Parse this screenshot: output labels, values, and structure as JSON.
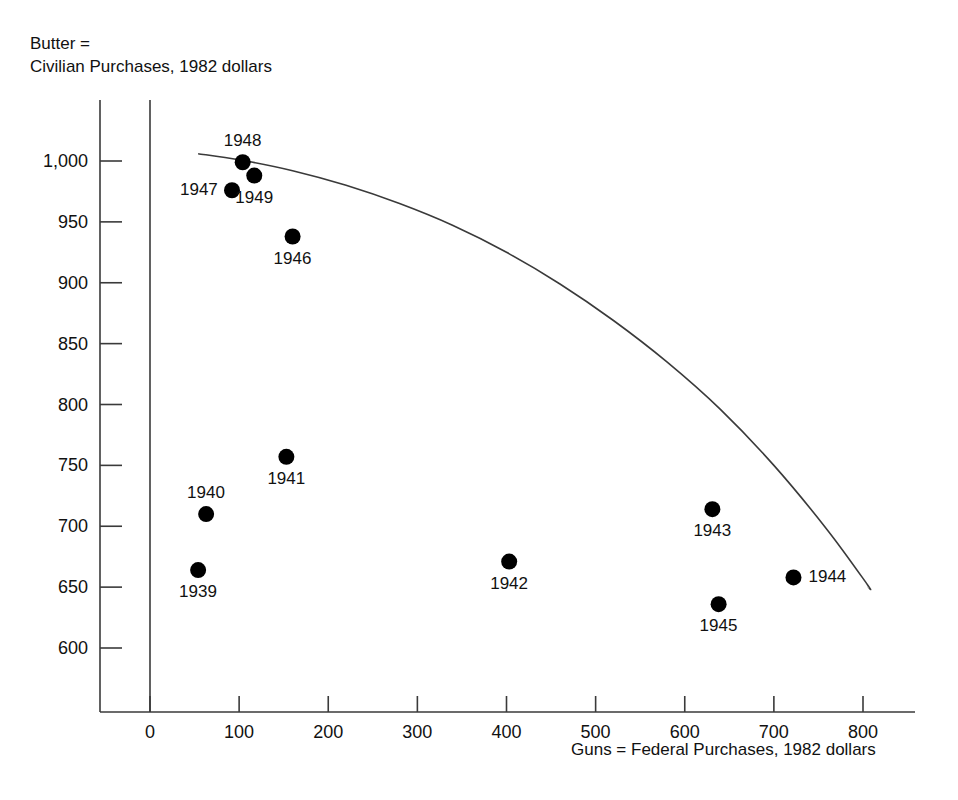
{
  "chart_data": {
    "type": "scatter",
    "title": "",
    "ylabel": "Butter =\nCivilian Purchases, 1982 dollars",
    "xlabel": "Guns = Federal Purchases, 1982 dollars",
    "xlim": [
      0,
      800
    ],
    "ylim": [
      570,
      1010
    ],
    "xticks": [
      0,
      100,
      200,
      300,
      400,
      500,
      600,
      700,
      800
    ],
    "xtick_labels": [
      "0",
      "100",
      "200",
      "300",
      "400",
      "500",
      "600",
      "700",
      "800"
    ],
    "yticks": [
      600,
      650,
      700,
      750,
      800,
      850,
      900,
      950,
      1000
    ],
    "ytick_labels": [
      "600",
      "650",
      "700",
      "750",
      "800",
      "850",
      "900",
      "950",
      "1,000"
    ],
    "grid": false,
    "legend": null,
    "point_color": "#000000",
    "curve_color": "#3a3a3a",
    "axis_color": "#3a3a3a",
    "points": [
      {
        "label": "1939",
        "x": 54,
        "y": 664,
        "label_pos": "below"
      },
      {
        "label": "1940",
        "x": 63,
        "y": 710,
        "label_pos": "above"
      },
      {
        "label": "1941",
        "x": 153,
        "y": 757,
        "label_pos": "below"
      },
      {
        "label": "1942",
        "x": 403,
        "y": 671,
        "label_pos": "below"
      },
      {
        "label": "1943",
        "x": 631,
        "y": 714,
        "label_pos": "below"
      },
      {
        "label": "1944",
        "x": 722,
        "y": 658,
        "label_pos": "right"
      },
      {
        "label": "1945",
        "x": 638,
        "y": 636,
        "label_pos": "below"
      },
      {
        "label": "1946",
        "x": 160,
        "y": 938,
        "label_pos": "below"
      },
      {
        "label": "1947",
        "x": 92,
        "y": 976,
        "label_pos": "left"
      },
      {
        "label": "1948",
        "x": 104,
        "y": 999,
        "label_pos": "above"
      },
      {
        "label": "1949",
        "x": 117,
        "y": 988,
        "label_pos": "below"
      }
    ],
    "curve": {
      "name": "production-possibilities-frontier",
      "points": [
        {
          "x": 54,
          "y": 1006
        },
        {
          "x": 100,
          "y": 1001
        },
        {
          "x": 160,
          "y": 992
        },
        {
          "x": 220,
          "y": 980
        },
        {
          "x": 280,
          "y": 965
        },
        {
          "x": 340,
          "y": 947
        },
        {
          "x": 400,
          "y": 925
        },
        {
          "x": 460,
          "y": 899
        },
        {
          "x": 520,
          "y": 869
        },
        {
          "x": 580,
          "y": 835
        },
        {
          "x": 640,
          "y": 796
        },
        {
          "x": 700,
          "y": 750
        },
        {
          "x": 760,
          "y": 697
        },
        {
          "x": 805,
          "y": 652
        },
        {
          "x": 806,
          "y": 650
        }
      ]
    }
  },
  "axis": {
    "x_axis_line_label": "x-axis",
    "y_axis_line_label": "y-axis"
  }
}
